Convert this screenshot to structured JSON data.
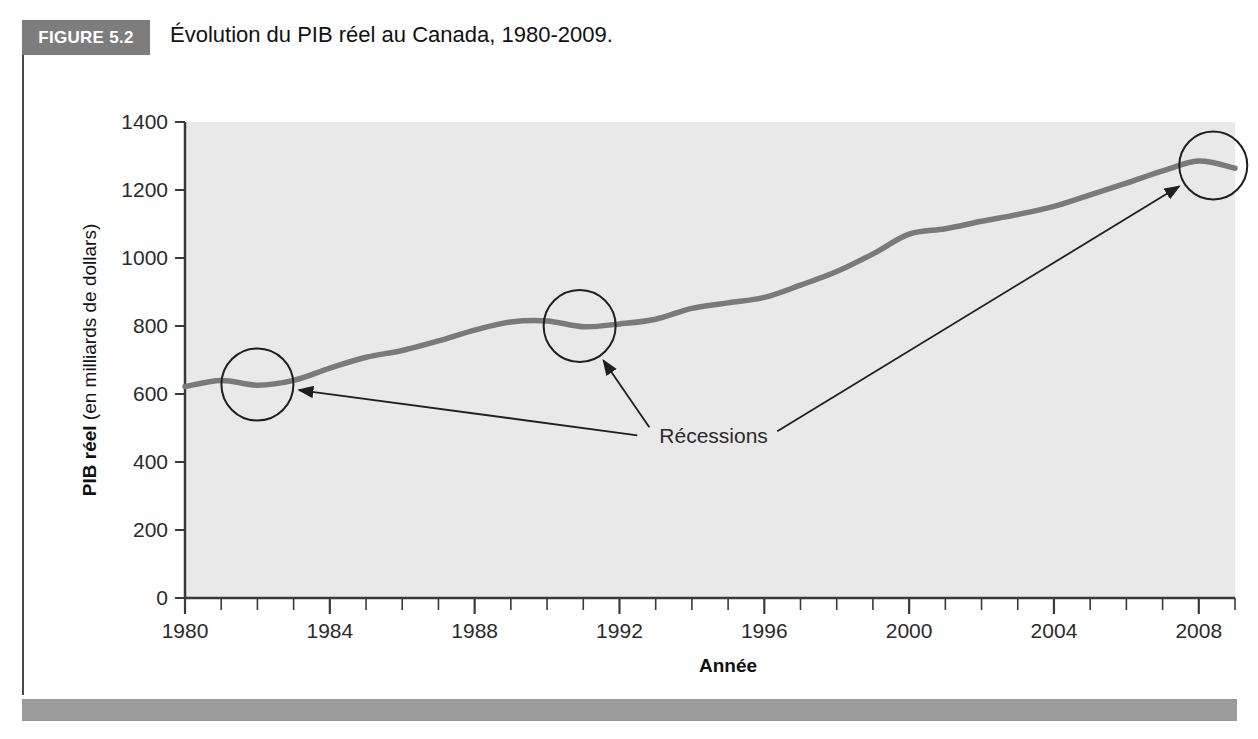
{
  "figure": {
    "badge_label": "FIGURE 5.2",
    "caption": "Évolution du PIB réel au Canada, 1980-2009."
  },
  "chart_data": {
    "type": "line",
    "title": "Évolution du PIB réel au Canada, 1980-2009.",
    "xlabel": "Année",
    "ylabel": "PIB réel (en milliards de dollars)",
    "ylabel_bold_part": "PIB réel",
    "ylabel_rest": " (en milliards de dollars)",
    "xlim": [
      1980,
      2009
    ],
    "ylim": [
      0,
      1400
    ],
    "yticks": [
      0,
      200,
      400,
      600,
      800,
      1000,
      1200,
      1400
    ],
    "xticks": [
      1980,
      1984,
      1988,
      1992,
      1996,
      2000,
      2004,
      2008
    ],
    "xminor_step": 1,
    "grid": false,
    "legend": "none",
    "plot_background": "#e9e9e9",
    "series": [
      {
        "name": "PIB réel du Canada",
        "color": "#7a7a7a",
        "x": [
          1980,
          1981,
          1982,
          1983,
          1984,
          1985,
          1986,
          1987,
          1988,
          1989,
          1990,
          1991,
          1992,
          1993,
          1994,
          1995,
          1996,
          1997,
          1998,
          1999,
          2000,
          2001,
          2002,
          2003,
          2004,
          2005,
          2006,
          2007,
          2008,
          2009
        ],
        "values": [
          622,
          640,
          626,
          640,
          676,
          708,
          728,
          756,
          788,
          812,
          815,
          798,
          806,
          820,
          852,
          868,
          884,
          920,
          960,
          1012,
          1070,
          1086,
          1108,
          1128,
          1152,
          1186,
          1220,
          1256,
          1285,
          1264
        ]
      }
    ],
    "annotations": [
      {
        "label": "Récessions",
        "label_x": 1993.1,
        "label_y": 455,
        "markers": [
          {
            "name": "recession-1982",
            "x": 1982.0,
            "y": 628,
            "radius_px": 36
          },
          {
            "name": "recession-1991",
            "x": 1990.9,
            "y": 800,
            "radius_px": 36
          },
          {
            "name": "recession-2008",
            "x": 2008.4,
            "y": 1272,
            "radius_px": 34
          }
        ]
      }
    ]
  }
}
